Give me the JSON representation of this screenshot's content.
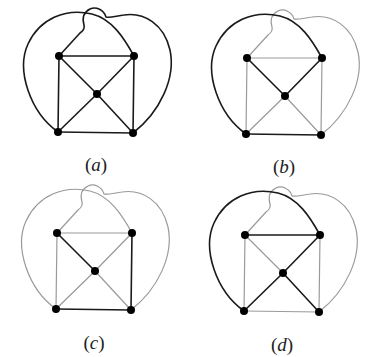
{
  "figure": {
    "type": "graph-panels",
    "colors": {
      "highlight": "#1a1a1a",
      "muted": "#9a9a9a",
      "vertex": "#000000",
      "background": "#ffffff"
    },
    "vertices": {
      "TL": [
        59,
        56
      ],
      "TR": [
        134,
        56
      ],
      "C": [
        97,
        94
      ],
      "BL": [
        58,
        132
      ],
      "BR": [
        133,
        133
      ]
    },
    "edges": [
      {
        "id": "TL-TR",
        "from": "TL",
        "to": "TR",
        "kind": "straight"
      },
      {
        "id": "BL-BR",
        "from": "BL",
        "to": "BR",
        "kind": "straight"
      },
      {
        "id": "TL-BL",
        "from": "TL",
        "to": "BL",
        "kind": "straight"
      },
      {
        "id": "TR-BR",
        "from": "TR",
        "to": "BR",
        "kind": "straight"
      },
      {
        "id": "TL-C",
        "from": "TL",
        "to": "C",
        "kind": "straight"
      },
      {
        "id": "TR-C",
        "from": "TR",
        "to": "C",
        "kind": "straight"
      },
      {
        "id": "BL-C",
        "from": "BL",
        "to": "C",
        "kind": "straight"
      },
      {
        "id": "BR-C",
        "from": "BR",
        "to": "C",
        "kind": "straight"
      },
      {
        "id": "BL-TR-outer",
        "from": "BL",
        "to": "TR",
        "kind": "curve-left"
      },
      {
        "id": "BR-TL-outer",
        "from": "BR",
        "to": "TL",
        "kind": "curve-right-bump"
      }
    ],
    "panels": [
      {
        "label": "a",
        "offset": [
          0,
          0
        ],
        "label_pos": [
          96,
          168
        ],
        "highlighted": [
          "TL-TR",
          "BL-BR",
          "TL-BL",
          "TR-BR",
          "TL-C",
          "TR-C",
          "BL-C",
          "BR-C",
          "BL-TR-outer",
          "BR-TL-outer"
        ]
      },
      {
        "label": "b",
        "offset": [
          188,
          2
        ],
        "label_pos": [
          284,
          170
        ],
        "highlighted": [
          "BL-TR-outer",
          "TL-C",
          "TR-C",
          "BL-BR"
        ]
      },
      {
        "label": "c",
        "offset": [
          -2,
          177
        ],
        "label_pos": [
          94,
          346
        ],
        "highlighted": [
          "TL-C",
          "TR-BR",
          "BL-BR"
        ]
      },
      {
        "label": "d",
        "offset": [
          186,
          179
        ],
        "label_pos": [
          282,
          348
        ],
        "highlighted": [
          "BL-TR-outer",
          "TL-TR",
          "TR-C",
          "BL-C",
          "BR-C"
        ]
      }
    ]
  }
}
